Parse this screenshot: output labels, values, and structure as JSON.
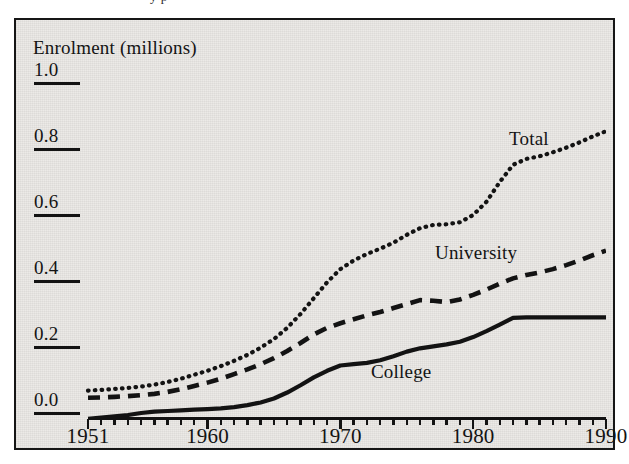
{
  "page": {
    "top_artifact_text": "                                   y                        p"
  },
  "figure": {
    "axis_title": "Enrolment (millions)",
    "y_ticks": [
      "1.0",
      "0.8",
      "0.6",
      "0.4",
      "0.2",
      "0.0"
    ],
    "x_ticks": [
      "1951",
      "1960",
      "1970",
      "1980",
      "1990"
    ],
    "series_labels": {
      "total": "Total",
      "university": "University",
      "college": "College"
    },
    "colors": {
      "ink": "#131313",
      "paper": "#eceae7",
      "frame": "#161616"
    }
  },
  "chart_data": {
    "type": "line",
    "title": "",
    "subtitle": "",
    "xlabel": "",
    "ylabel": "Enrolment (millions)",
    "xlim": [
      1951,
      1990
    ],
    "ylim": [
      -0.05,
      1.0
    ],
    "y_tick_values": [
      0.0,
      0.2,
      0.4,
      0.6,
      0.8,
      1.0
    ],
    "x_tick_values": [
      1951,
      1960,
      1970,
      1980,
      1990
    ],
    "x_minor_tick_interval": 1,
    "grid": false,
    "legend": "inline-annotations",
    "legend_position": "in-plot",
    "x": [
      1951,
      1952,
      1953,
      1954,
      1955,
      1956,
      1957,
      1958,
      1959,
      1960,
      1961,
      1962,
      1963,
      1964,
      1965,
      1966,
      1967,
      1968,
      1969,
      1970,
      1971,
      1972,
      1973,
      1974,
      1975,
      1976,
      1977,
      1978,
      1979,
      1980,
      1981,
      1982,
      1983,
      1984,
      1985,
      1986,
      1987,
      1988,
      1989,
      1990
    ],
    "series": [
      {
        "name": "Total",
        "style": "dotted",
        "values": [
          0.068,
          0.07,
          0.073,
          0.076,
          0.08,
          0.086,
          0.094,
          0.104,
          0.116,
          0.128,
          0.142,
          0.158,
          0.176,
          0.198,
          0.224,
          0.258,
          0.3,
          0.348,
          0.396,
          0.436,
          0.462,
          0.482,
          0.498,
          0.516,
          0.54,
          0.56,
          0.57,
          0.572,
          0.578,
          0.6,
          0.64,
          0.7,
          0.752,
          0.77,
          0.778,
          0.79,
          0.804,
          0.82,
          0.838,
          0.854
        ]
      },
      {
        "name": "University",
        "style": "dashed",
        "values": [
          0.046,
          0.047,
          0.049,
          0.051,
          0.054,
          0.058,
          0.064,
          0.072,
          0.082,
          0.092,
          0.104,
          0.118,
          0.132,
          0.148,
          0.166,
          0.188,
          0.212,
          0.238,
          0.258,
          0.272,
          0.284,
          0.296,
          0.306,
          0.318,
          0.33,
          0.342,
          0.34,
          0.336,
          0.344,
          0.358,
          0.374,
          0.392,
          0.408,
          0.418,
          0.426,
          0.436,
          0.448,
          0.462,
          0.478,
          0.492
        ]
      },
      {
        "name": "College",
        "style": "solid",
        "values": [
          -0.018,
          -0.014,
          -0.01,
          -0.006,
          0.0,
          0.004,
          0.006,
          0.008,
          0.01,
          0.012,
          0.014,
          0.018,
          0.024,
          0.032,
          0.044,
          0.062,
          0.084,
          0.108,
          0.128,
          0.144,
          0.148,
          0.152,
          0.16,
          0.172,
          0.186,
          0.196,
          0.202,
          0.208,
          0.216,
          0.23,
          0.248,
          0.268,
          0.288,
          0.29,
          0.29,
          0.29,
          0.29,
          0.29,
          0.29,
          0.29
        ]
      }
    ]
  }
}
